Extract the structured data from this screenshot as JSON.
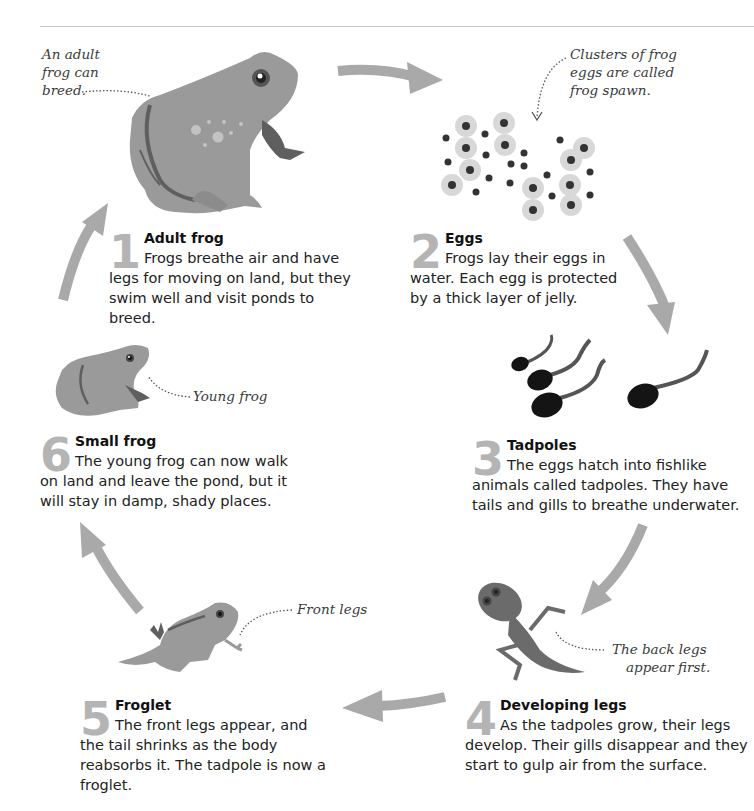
{
  "diagram": {
    "type": "life-cycle",
    "colors": {
      "arrow": "#a9a9a9",
      "frog_body": "#9a9a9a",
      "frog_dark": "#5f5f5f",
      "number": "#b4b4b4",
      "tadpole": "#141414",
      "egg_jelly": "#d8d8d8",
      "text": "#1a1a1a",
      "rule": "#c8c8c8"
    },
    "stages": [
      {
        "number": "1",
        "title": "Adult frog",
        "description": "Frogs breathe air and have legs for moving on land, but they swim well and visit ponds to breed.",
        "illustration": "adult-frog-icon",
        "annotation": "An adult frog can breed."
      },
      {
        "number": "2",
        "title": "Eggs",
        "description": "Frogs lay their eggs in water. Each egg is protected by a thick layer of jelly.",
        "illustration": "frog-spawn-icon",
        "annotation": "Clusters of frog eggs are called frog spawn."
      },
      {
        "number": "3",
        "title": "Tadpoles",
        "description": "The eggs hatch into fishlike animals called tadpoles. They have tails and gills to breathe underwater.",
        "illustration": "tadpoles-icon",
        "annotation": ""
      },
      {
        "number": "4",
        "title": "Developing legs",
        "description": "As the tadpoles grow, their legs develop. Their gills disappear and they start to gulp air from the surface.",
        "illustration": "tadpole-with-legs-icon",
        "annotation": "The back legs appear first."
      },
      {
        "number": "5",
        "title": "Froglet",
        "description": "The front legs appear, and the tail shrinks as the body reabsorbs it. The tadpole is now a froglet.",
        "illustration": "froglet-icon",
        "annotation": "Front legs"
      },
      {
        "number": "6",
        "title": "Small frog",
        "description": "The young frog can now walk on land and leave the pond, but it will stay in damp, shady places.",
        "illustration": "young-frog-icon",
        "annotation": "Young frog"
      }
    ],
    "annotations": {
      "adult_line1": "An adult",
      "adult_line2": "frog can",
      "adult_line3": "breed.",
      "eggs_line1": "Clusters of frog",
      "eggs_line2": "eggs are called",
      "eggs_line3": "frog spawn.",
      "young": "Young frog",
      "front_legs": "Front legs",
      "back_line1": "The back legs",
      "back_line2": "appear first."
    },
    "arrows": [
      {
        "from": "1",
        "to": "2",
        "direction": "right"
      },
      {
        "from": "2",
        "to": "3",
        "direction": "down"
      },
      {
        "from": "3",
        "to": "4",
        "direction": "down-left"
      },
      {
        "from": "4",
        "to": "5",
        "direction": "left"
      },
      {
        "from": "5",
        "to": "6",
        "direction": "up-left"
      },
      {
        "from": "6",
        "to": "1",
        "direction": "up"
      }
    ]
  }
}
